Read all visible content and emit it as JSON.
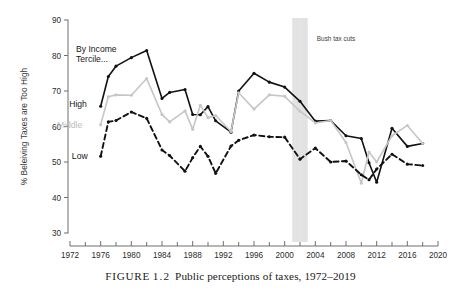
{
  "figure": {
    "caption_tag": "FIGURE",
    "caption_number": "1.2",
    "caption_text": "Public perceptions of taxes, 1972–2019"
  },
  "chart_data": {
    "type": "line",
    "title": "",
    "subtitle": "",
    "xlabel": "",
    "ylabel": "% Beleiving Taxes are Too High",
    "xlim": [
      1972,
      2020
    ],
    "ylim": [
      30,
      90
    ],
    "xticks": [
      1972,
      1976,
      1980,
      1984,
      1988,
      1992,
      1996,
      2000,
      2004,
      2008,
      2012,
      2016,
      2020
    ],
    "xtick_labels": [
      "1972",
      "1976",
      "1980",
      "1984",
      "1988",
      "1992",
      "1996",
      "2000",
      "2004",
      "2008",
      "2012",
      "2016",
      "2020"
    ],
    "xminor_step": 2,
    "yticks": [
      30,
      40,
      50,
      60,
      70,
      80,
      90
    ],
    "ytick_labels": [
      "30",
      "40",
      "50",
      "60",
      "70",
      "80",
      "90"
    ],
    "grid": false,
    "legend_position": "inline-left",
    "legend_title": "By Income Tercile...",
    "series": [
      {
        "name": "High",
        "label": "High",
        "color": "#111111",
        "style": "solid",
        "marker": "circle",
        "label_x": 1974.2,
        "label_y": 66.4,
        "x": [
          1976,
          1977,
          1978,
          1980,
          1982,
          1984,
          1985,
          1987,
          1988,
          1989,
          1990,
          1991,
          1993,
          1994,
          1996,
          1998,
          2000,
          2002,
          2004,
          2006,
          2008,
          2010,
          2011,
          2012,
          2014,
          2016,
          2018
        ],
        "y": [
          65.7,
          74.1,
          77.0,
          79.4,
          81.4,
          67.9,
          69.6,
          70.4,
          63.4,
          63.3,
          65.6,
          61.6,
          58.4,
          70.0,
          75.0,
          72.5,
          71.1,
          67.1,
          61.5,
          61.7,
          57.4,
          56.6,
          49.8,
          44.3,
          59.5,
          54.4,
          55.2
        ]
      },
      {
        "name": "Middle",
        "label": "Middle",
        "color": "#c6c6c6",
        "style": "solid",
        "marker": "circle",
        "label_x": 1973.6,
        "label_y": 60.4,
        "x": [
          1976,
          1977,
          1978,
          1980,
          1982,
          1984,
          1985,
          1987,
          1988,
          1989,
          1990,
          1991,
          1993,
          1994,
          1996,
          1998,
          2000,
          2002,
          2004,
          2006,
          2008,
          2010,
          2011,
          2012,
          2014,
          2016,
          2018
        ],
        "y": [
          60.5,
          68.4,
          68.9,
          68.8,
          73.5,
          63.4,
          61.3,
          64.4,
          59.2,
          66.0,
          62.5,
          63.1,
          58.6,
          69.5,
          64.9,
          68.9,
          68.5,
          64.3,
          61.0,
          61.7,
          55.5,
          44.0,
          52.8,
          50.0,
          57.4,
          60.3,
          55.2
        ]
      },
      {
        "name": "Low",
        "label": "Low",
        "color": "#111111",
        "style": "dashed",
        "marker": "circle",
        "label_x": 1974.3,
        "label_y": 51.6,
        "x": [
          1976,
          1977,
          1978,
          1980,
          1982,
          1984,
          1985,
          1987,
          1988,
          1989,
          1990,
          1991,
          1993,
          1994,
          1996,
          1998,
          2000,
          2002,
          2004,
          2006,
          2008,
          2010,
          2011,
          2012,
          2014,
          2016,
          2018
        ],
        "y": [
          51.6,
          61.3,
          61.7,
          64.1,
          62.3,
          53.4,
          51.8,
          47.4,
          51.2,
          54.4,
          51.6,
          46.8,
          54.5,
          56.1,
          57.6,
          57.1,
          57.0,
          50.8,
          53.9,
          50.0,
          50.3,
          46.4,
          45.0,
          48.0,
          52.2,
          49.4,
          49.0
        ]
      }
    ],
    "annotations": [
      {
        "name": "bush-tax-cuts",
        "text": "Bush tax cuts",
        "band_start": 2001,
        "band_end": 2003,
        "band_color": "#e8e8e8",
        "text_x": 2004.2,
        "text_y": 84.2
      }
    ]
  }
}
